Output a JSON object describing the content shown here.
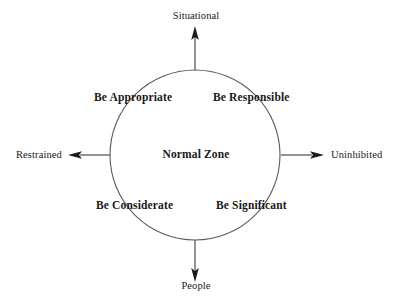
{
  "diagram": {
    "title": "Normal Zone",
    "center_label": "Normal Zone",
    "axes": [
      {
        "id": "situational",
        "label": "Situational",
        "direction": "up",
        "icon": "arrow-up-icon"
      },
      {
        "id": "people",
        "label": "People",
        "direction": "down",
        "icon": "arrow-down-icon"
      },
      {
        "id": "restrained",
        "label": "Restrained",
        "direction": "left",
        "icon": "arrow-left-icon"
      },
      {
        "id": "uninhibited",
        "label": "Uninhibited",
        "direction": "right",
        "icon": "arrow-right-icon"
      }
    ],
    "quadrants": [
      {
        "id": "be-appropriate",
        "label": "Be Appropriate",
        "position": "top-left"
      },
      {
        "id": "be-responsible",
        "label": "Be Responsible",
        "position": "top-right"
      },
      {
        "id": "be-considerate",
        "label": "Be Considerate",
        "position": "bottom-left"
      },
      {
        "id": "be-significant",
        "label": "Be Significant",
        "position": "bottom-right"
      }
    ],
    "geometry": {
      "center_x": 195,
      "center_y": 155,
      "radius": 85
    },
    "colors": {
      "background": "#ffffff",
      "stroke": "#5a5a5a",
      "text": "#191919",
      "arrowhead": "#1a1a1a"
    }
  }
}
